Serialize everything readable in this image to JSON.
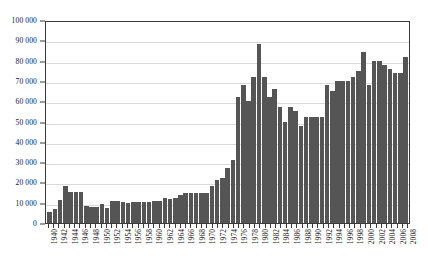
{
  "chart_data": {
    "type": "bar",
    "title": "",
    "subtitle": "",
    "xlabel": "",
    "ylabel": "",
    "ylim": [
      0,
      100000
    ],
    "ytick_step": 10000,
    "grid": true,
    "legend": null,
    "bar_color": "#555555",
    "gridline_color": "#d9d9d9",
    "axis_color": "#3a3a3a",
    "ytick_labels": [
      "100 000",
      "90 000",
      "80 000",
      "70 000",
      "60 000",
      "50 000",
      "40 000",
      "30 000",
      "20 000",
      "10 000",
      "0"
    ],
    "ytick_values": [
      100000,
      90000,
      80000,
      70000,
      60000,
      50000,
      40000,
      30000,
      20000,
      10000,
      0
    ],
    "xtick_labels": [
      "1940",
      "1942",
      "1944",
      "1946",
      "1948",
      "1950",
      "1952",
      "1954",
      "1956",
      "1958",
      "1960",
      "1962",
      "1964",
      "1966",
      "1968",
      "1970",
      "1972",
      "1974",
      "1976",
      "1978",
      "1980",
      "1982",
      "1984",
      "1986",
      "1988",
      "1990",
      "1992",
      "1994",
      "1996",
      "1998",
      "2000",
      "2002",
      "2004",
      "2006",
      "2008"
    ],
    "xtick_label_interval": 2,
    "categories": [
      "1940",
      "1941",
      "1942",
      "1943",
      "1944",
      "1945",
      "1946",
      "1947",
      "1948",
      "1949",
      "1950",
      "1951",
      "1952",
      "1953",
      "1954",
      "1955",
      "1956",
      "1957",
      "1958",
      "1959",
      "1960",
      "1961",
      "1962",
      "1963",
      "1964",
      "1965",
      "1966",
      "1967",
      "1968",
      "1969",
      "1970",
      "1971",
      "1972",
      "1973",
      "1974",
      "1975",
      "1976",
      "1977",
      "1978",
      "1979",
      "1980",
      "1981",
      "1982",
      "1983",
      "1984",
      "1985",
      "1986",
      "1987",
      "1988",
      "1989",
      "1990",
      "1991",
      "1992",
      "1993",
      "1994",
      "1995",
      "1996",
      "1997",
      "1998",
      "1999",
      "2000",
      "2001",
      "2002",
      "2003",
      "2004",
      "2005",
      "2006",
      "2007",
      "2008"
    ],
    "values": [
      5200,
      7000,
      11500,
      18000,
      15500,
      15500,
      15500,
      8500,
      8000,
      8000,
      9500,
      7500,
      11000,
      11000,
      10500,
      10000,
      10500,
      10500,
      10500,
      10500,
      11000,
      11000,
      12500,
      12000,
      12500,
      14000,
      15000,
      15000,
      15000,
      15000,
      15000,
      18000,
      21000,
      22000,
      27000,
      31000,
      62000,
      68000,
      60000,
      72000,
      88000,
      72000,
      62000,
      66000,
      57000,
      50000,
      57000,
      55000,
      48000,
      52000,
      52000,
      52000,
      52000,
      68000,
      65000,
      70000,
      70000,
      70000,
      72000,
      75000,
      84000,
      68000,
      80000,
      80000,
      78000,
      76000,
      74000,
      74000,
      82000
    ]
  }
}
